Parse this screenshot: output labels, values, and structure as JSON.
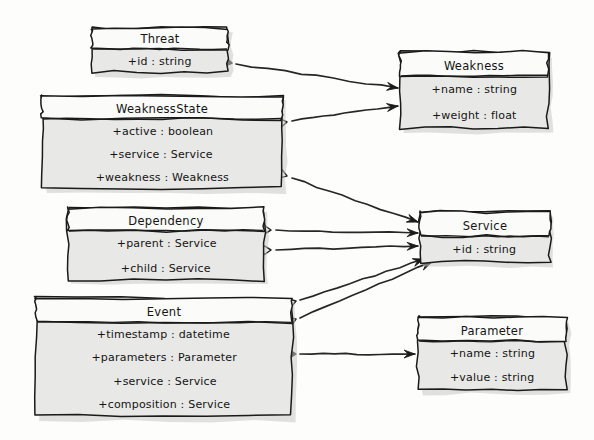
{
  "diagram": {
    "kind": "uml-class-diagram",
    "style": "hand-drawn-sketch",
    "background_color": "#fdfdfc",
    "box_fill_color": "#e8e8e6",
    "title_fill_color": "#fbfbfa",
    "stroke_color": "#1a1a1a"
  },
  "classes": [
    {
      "id": "threat",
      "name": "Threat",
      "attributes": [
        "+id : string"
      ],
      "x": 92,
      "y": 28,
      "w": 136,
      "h": 44,
      "title_h": 21
    },
    {
      "id": "weakness",
      "name": "Weakness",
      "attributes": [
        "+name : string",
        "+weight : float"
      ],
      "x": 400,
      "y": 52,
      "w": 148,
      "h": 76,
      "title_h": 24
    },
    {
      "id": "weaknessstate",
      "name": "WeaknessState",
      "attributes": [
        "+active : boolean",
        "+service : Service",
        "+weakness : Weakness"
      ],
      "x": 42,
      "y": 96,
      "w": 240,
      "h": 92,
      "title_h": 23
    },
    {
      "id": "dependency",
      "name": "Dependency",
      "attributes": [
        "+parent : Service",
        "+child : Service"
      ],
      "x": 68,
      "y": 208,
      "w": 196,
      "h": 72,
      "title_h": 23
    },
    {
      "id": "service",
      "name": "Service",
      "attributes": [
        "+id : string"
      ],
      "x": 420,
      "y": 212,
      "w": 130,
      "h": 50,
      "title_h": 24
    },
    {
      "id": "event",
      "name": "Event",
      "attributes": [
        "+timestamp : datetime",
        "+parameters : Parameter",
        "+service : Service",
        "+composition : Service"
      ],
      "x": 36,
      "y": 298,
      "w": 256,
      "h": 118,
      "title_h": 24
    },
    {
      "id": "parameter",
      "name": "Parameter",
      "attributes": [
        "+name : string",
        "+value : string"
      ],
      "x": 418,
      "y": 317,
      "w": 148,
      "h": 72,
      "title_h": 24
    }
  ],
  "relationships": [
    {
      "id": "threat-weakness",
      "from": "Threat",
      "to": "Weakness",
      "kind": "composition",
      "end_marker": "filled-diamond",
      "arrow": true,
      "path": "M 236 64 L 398 88",
      "marker_x": 232,
      "marker_y": 63,
      "marker_angle": 8.4,
      "arrow_x": 398,
      "arrow_y": 88,
      "arrow_angle": 8.4
    },
    {
      "id": "weaknessstate-weakness",
      "from": "WeaknessState",
      "to": "Weakness",
      "kind": "aggregation",
      "end_marker": "hollow-diamond",
      "arrow": true,
      "path": "M 292 121 L 398 106",
      "marker_x": 287,
      "marker_y": 122,
      "marker_angle": -8.0,
      "arrow_x": 398,
      "arrow_y": 106,
      "arrow_angle": -8.0
    },
    {
      "id": "weaknessstate-service",
      "from": "WeaknessState",
      "to": "Service",
      "kind": "aggregation",
      "end_marker": "hollow-diamond",
      "arrow": true,
      "path": "M 292 178 L 418 222",
      "marker_x": 287,
      "marker_y": 176,
      "marker_angle": 19.3,
      "arrow_x": 418,
      "arrow_y": 222,
      "arrow_angle": 19.3
    },
    {
      "id": "dependency-service-parent",
      "from": "Dependency",
      "to": "Service",
      "kind": "aggregation",
      "end_marker": "hollow-diamond",
      "arrow": true,
      "path": "M 276 230 L 418 233",
      "marker_x": 271,
      "marker_y": 230,
      "marker_angle": 1.2,
      "arrow_x": 418,
      "arrow_y": 233,
      "arrow_angle": 1.2
    },
    {
      "id": "dependency-service-child",
      "from": "Dependency",
      "to": "Service",
      "kind": "aggregation",
      "end_marker": "hollow-diamond",
      "arrow": true,
      "path": "M 276 250 L 418 246",
      "marker_x": 271,
      "marker_y": 250,
      "marker_angle": -1.6,
      "arrow_x": 418,
      "arrow_y": 246,
      "arrow_angle": -1.6
    },
    {
      "id": "event-service-service",
      "from": "Event",
      "to": "Service",
      "kind": "aggregation",
      "end_marker": "hollow-diamond",
      "arrow": true,
      "path": "M 300 300 L 424 259",
      "marker_x": 296,
      "marker_y": 301,
      "marker_angle": -18.3,
      "arrow_x": 424,
      "arrow_y": 259,
      "arrow_angle": -18.3
    },
    {
      "id": "event-service-composition",
      "from": "Event",
      "to": "Service",
      "kind": "aggregation",
      "end_marker": "hollow-diamond",
      "arrow": true,
      "path": "M 300 318 L 432 262",
      "marker_x": 296,
      "marker_y": 319,
      "marker_angle": -23.0,
      "arrow_x": 432,
      "arrow_y": 262,
      "arrow_angle": -23.0
    },
    {
      "id": "event-parameter",
      "from": "Event",
      "to": "Parameter",
      "kind": "composition",
      "end_marker": "filled-diamond",
      "arrow": true,
      "path": "M 300 354 L 415 354",
      "marker_x": 296,
      "marker_y": 354,
      "marker_angle": 0,
      "arrow_x": 415,
      "arrow_y": 354,
      "arrow_angle": 0
    }
  ]
}
